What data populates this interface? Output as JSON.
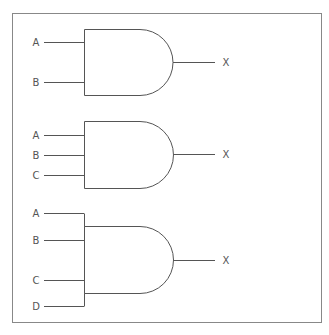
{
  "diagram": {
    "type": "logic-gates",
    "frame": {
      "x": 12.5,
      "y": 13.5,
      "w": 309,
      "h": 309
    },
    "gates": [
      {
        "kind": "AND",
        "inputs": [
          "A",
          "B"
        ],
        "output": "X",
        "body": {
          "x": 84,
          "y1": 29,
          "y2": 95,
          "flat_end": 140
        },
        "input_y": [
          42,
          82
        ],
        "output_y": 62,
        "bus": null
      },
      {
        "kind": "AND",
        "inputs": [
          "A",
          "B",
          "C"
        ],
        "output": "X",
        "body": {
          "x": 84,
          "y1": 121,
          "y2": 188,
          "flat_end": 140
        },
        "input_y": [
          135,
          155,
          175
        ],
        "output_y": 154,
        "bus": null
      },
      {
        "kind": "AND",
        "inputs": [
          "A",
          "B",
          "C",
          "D"
        ],
        "output": "X",
        "body": {
          "x": 84,
          "y1": 226,
          "y2": 293,
          "flat_end": 140
        },
        "input_y": [
          213,
          240,
          280,
          306
        ],
        "output_y": 260,
        "bus": {
          "x": 84,
          "y1": 213,
          "y2": 306
        }
      }
    ],
    "wire_start_x": 44,
    "output_end_x": 215,
    "label_in_x": 36,
    "label_out_x": 226,
    "colors": {
      "stroke": "#555555",
      "frame": "#888888",
      "text": "#555555"
    }
  }
}
